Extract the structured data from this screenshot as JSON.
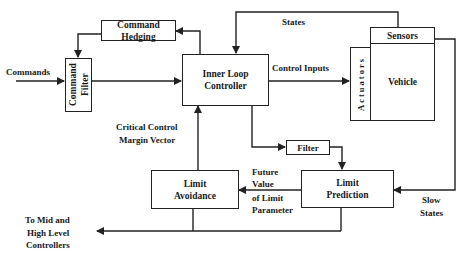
{
  "blocks": {
    "command_hedging": "Command Hedging",
    "command_filter": "Command Filter",
    "inner_loop_controller": "Inner Loop Controller",
    "sensors": "Sensors",
    "actuators": "Actuators",
    "vehicle": "Vehicle",
    "filter": "Filter",
    "limit_prediction": "Limit Prediction",
    "limit_avoidance": "Limit Avoidance"
  },
  "labels": {
    "commands": "Commands",
    "states": "States",
    "control_inputs": "Control Inputs",
    "critical_control_1": "Critical Control",
    "critical_control_2": "Margin Vector",
    "future_1": "Future",
    "future_2": "Value",
    "future_3": "of Limit",
    "future_4": "Parameter",
    "slow_1": "Slow",
    "slow_2": "States",
    "to_mid_1": "To Mid and",
    "to_mid_2": "High Level",
    "to_mid_3": "Controllers"
  }
}
